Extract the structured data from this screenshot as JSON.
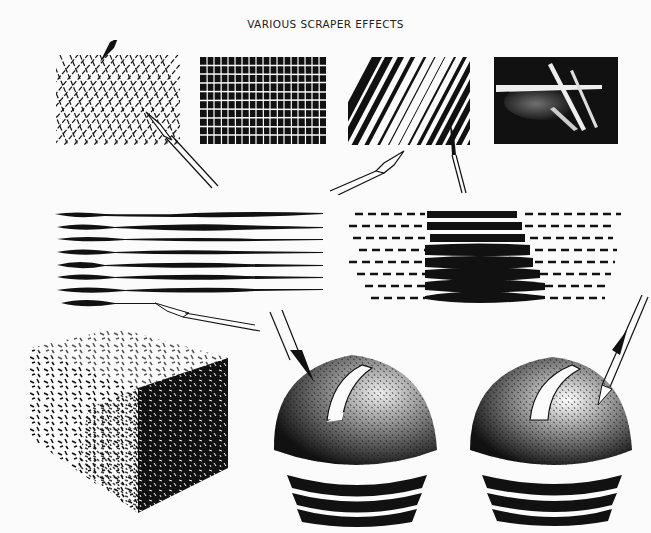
{
  "page": {
    "title": "VARIOUS SCRAPER EFFECTS",
    "background": "#fbfbfb",
    "ink": "#111111"
  },
  "illustrations": [
    {
      "id": "crosshatch",
      "description": "Scraped crosshatch grid with pen nib and scraper tool"
    },
    {
      "id": "grid-blocks",
      "description": "Black blocks separated by scraped white grid lines"
    },
    {
      "id": "diagonal-lines",
      "description": "Diagonal black stripes with pen and brush"
    },
    {
      "id": "light-streaks",
      "description": "White streaks scraped on black background"
    },
    {
      "id": "tapered-lines",
      "description": "Horizontal tapered lines with brush"
    },
    {
      "id": "dashed-lens",
      "description": "Dashed lines swelling into solid lens shape"
    },
    {
      "id": "stippled-cube",
      "description": "Cube rendered with scraped dashes"
    },
    {
      "id": "dome-left",
      "description": "Textured dome on threaded base with scraper"
    },
    {
      "id": "dome-right",
      "description": "Textured dome on threaded base with highlight and scraper"
    }
  ]
}
